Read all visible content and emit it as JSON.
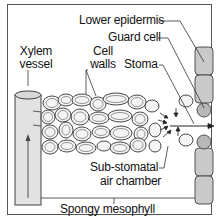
{
  "diagram": {
    "type": "biology-leaf-cross-section",
    "labels": {
      "lower_epidermis": "Lower epidermis",
      "guard_cell": "Guard cell",
      "xylem_line1": "Xylem",
      "xylem_line2": "vessel",
      "cell_walls_line1": "Cell",
      "cell_walls_line2": "walls",
      "stoma": "Stoma",
      "substomatal_line1": "Sub-stomatal",
      "substomatal_line2": "air chamber",
      "spongy_mesophyll": "Spongy mesophyll"
    },
    "colors": {
      "cell_fill": "#cfcfcf",
      "outline": "#333333",
      "background": "#ffffff"
    }
  }
}
